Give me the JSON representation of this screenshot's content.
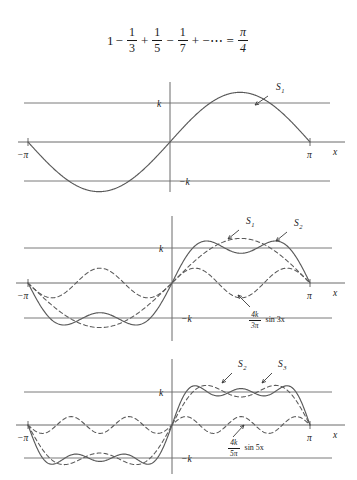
{
  "figure": {
    "title_formula": {
      "lead": "1",
      "terms": [
        {
          "op": "−",
          "num": "1",
          "den": "3"
        },
        {
          "op": "+",
          "num": "1",
          "den": "5"
        },
        {
          "op": "−",
          "num": "1",
          "den": "7"
        }
      ],
      "tail_op": "+ −⋯",
      "equals": "=",
      "result_num": "π",
      "result_den": "4",
      "plain_text": "1 − 1/3 + 1/5 − 1/7 + −⋯ = π/4"
    },
    "axis_labels": {
      "x_axis": "x",
      "left_tick": "−π",
      "right_tick": "π",
      "level_pos": "k",
      "level_neg": "−k"
    },
    "colors": {
      "curve": "#5a5a5a",
      "axis": "#6b6b6b",
      "level": "#7a7a7a",
      "text": "#1a1a1a",
      "background": "#ffffff"
    },
    "panels": [
      {
        "id": "panel-1",
        "name": "first-partial-sum",
        "curves": [
          {
            "name": "S1",
            "label": "S",
            "sub": "1",
            "style": "solid",
            "harmonics": [
              1
            ]
          }
        ],
        "annotations": [
          {
            "name": "s1-label",
            "label": "S",
            "sub": "1"
          }
        ],
        "component_label": null
      },
      {
        "id": "panel-2",
        "name": "second-partial-sum",
        "curves": [
          {
            "name": "S1",
            "label": "S",
            "sub": "1",
            "style": "dashed",
            "harmonics": [
              1
            ]
          },
          {
            "name": "S2",
            "label": "S",
            "sub": "2",
            "style": "solid",
            "harmonics": [
              1,
              3
            ]
          },
          {
            "name": "H3",
            "label": "4k/3π sin 3x",
            "sub": "",
            "style": "dashed",
            "harmonics": [
              3
            ]
          }
        ],
        "annotations": [
          {
            "name": "s1-label",
            "label": "S",
            "sub": "1"
          },
          {
            "name": "s2-label",
            "label": "S",
            "sub": "2"
          }
        ],
        "component_label": {
          "num": "4k",
          "den": "3π",
          "tail": "sin 3x",
          "plain_text": "4k/3π sin 3x"
        }
      },
      {
        "id": "panel-3",
        "name": "third-partial-sum",
        "curves": [
          {
            "name": "S2",
            "label": "S",
            "sub": "2",
            "style": "dashed",
            "harmonics": [
              1,
              3
            ]
          },
          {
            "name": "S3",
            "label": "S",
            "sub": "3",
            "style": "solid",
            "harmonics": [
              1,
              3,
              5
            ]
          },
          {
            "name": "H5",
            "label": "4k/5π sin 5x",
            "sub": "",
            "style": "dashed",
            "harmonics": [
              5
            ]
          }
        ],
        "annotations": [
          {
            "name": "s2-label",
            "label": "S",
            "sub": "2"
          },
          {
            "name": "s3-label",
            "label": "S",
            "sub": "3"
          }
        ],
        "component_label": {
          "num": "4k",
          "den": "5π",
          "tail": "sin 5x",
          "plain_text": "4k/5π sin 5x"
        }
      }
    ]
  },
  "chart_data": {
    "type": "line",
    "xlabel": "x",
    "ylabel": "",
    "xlim": [
      -3.14159,
      3.14159
    ],
    "ylim": [
      -1.45,
      1.45
    ],
    "xticks": [
      -3.14159,
      3.14159
    ],
    "xticklabels": [
      "−π",
      "π"
    ],
    "yticks": [
      -1,
      1
    ],
    "yticklabels": [
      "−k",
      "k"
    ],
    "grid": false,
    "legend": "inline-annotations",
    "amplitude_unit": "k",
    "series": [
      {
        "name": "S1",
        "panel": "panel-1",
        "style": "solid",
        "formula": "(4k/π) sin x",
        "harmonics": [
          1
        ]
      },
      {
        "name": "S1",
        "panel": "panel-2",
        "style": "dashed",
        "formula": "(4k/π) sin x",
        "harmonics": [
          1
        ]
      },
      {
        "name": "S2",
        "panel": "panel-2",
        "style": "solid",
        "formula": "(4k/π)(sin x + (1/3) sin 3x)",
        "harmonics": [
          1,
          3
        ]
      },
      {
        "name": "4k/3π sin 3x",
        "panel": "panel-2",
        "style": "dashed",
        "formula": "(4k/3π) sin 3x",
        "harmonics": [
          3
        ]
      },
      {
        "name": "S2",
        "panel": "panel-3",
        "style": "dashed",
        "formula": "(4k/π)(sin x + (1/3) sin 3x)",
        "harmonics": [
          1,
          3
        ]
      },
      {
        "name": "S3",
        "panel": "panel-3",
        "style": "solid",
        "formula": "(4k/π)(sin x + (1/3) sin 3x + (1/5) sin 5x)",
        "harmonics": [
          1,
          3,
          5
        ]
      },
      {
        "name": "4k/5π sin 5x",
        "panel": "panel-3",
        "style": "dashed",
        "formula": "(4k/5π) sin 5x",
        "harmonics": [
          5
        ]
      }
    ]
  }
}
